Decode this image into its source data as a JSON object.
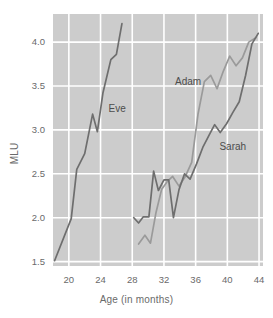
{
  "chart_data": {
    "type": "line",
    "title": "",
    "xlabel": "Age (in months)",
    "ylabel": "MLU",
    "xlim": [
      18,
      44.5
    ],
    "ylim": [
      1.45,
      4.32
    ],
    "xticks": [
      20,
      24,
      28,
      32,
      36,
      40,
      44
    ],
    "xticklabels": [
      "20",
      "24",
      "28",
      "32",
      "36",
      "40",
      "44"
    ],
    "yticks": [
      1.5,
      2.0,
      2.5,
      3.0,
      3.5,
      4.0
    ],
    "yticklabels": [
      "1.5",
      "2.0",
      "2.5",
      "3.0",
      "3.5",
      "4.0"
    ],
    "grid": true,
    "grid_color": "#ffffff",
    "plot_background": "#cccccc",
    "legend": "inline-labels",
    "series": [
      {
        "name": "Eve",
        "color": "#6e6e6e",
        "label_x": 25.0,
        "label_y": 3.24,
        "x": [
          18.2,
          20.3,
          21.0,
          22.0,
          23.0,
          23.6,
          24.3,
          25.3,
          26.0,
          26.7
        ],
        "y": [
          1.51,
          1.99,
          2.55,
          2.73,
          3.18,
          2.98,
          3.42,
          3.8,
          3.86,
          4.21
        ]
      },
      {
        "name": "Adam",
        "color": "#9a9a9a",
        "label_x": 33.4,
        "label_y": 3.54,
        "x": [
          28.8,
          29.6,
          30.3,
          31.0,
          31.7,
          32.4,
          33.1,
          33.9,
          34.7,
          35.5,
          36.3,
          37.1,
          37.9,
          38.7,
          39.5,
          40.3,
          41.1,
          41.9,
          42.7,
          43.6
        ],
        "y": [
          1.7,
          1.8,
          1.71,
          2.06,
          2.32,
          2.41,
          2.47,
          2.36,
          2.47,
          2.63,
          3.18,
          3.55,
          3.62,
          3.47,
          3.67,
          3.84,
          3.73,
          3.82,
          4.0,
          4.05
        ]
      },
      {
        "name": "Sarah",
        "color": "#6e6e6e",
        "label_x": 39.0,
        "label_y": 2.8,
        "x": [
          28.2,
          28.8,
          29.4,
          30.1,
          30.7,
          31.3,
          32.0,
          32.6,
          33.2,
          33.9,
          34.6,
          35.3,
          36.1,
          36.9,
          37.7,
          38.4,
          39.1,
          39.9,
          40.7,
          41.5,
          42.3,
          43.1,
          43.9
        ],
        "y": [
          2.0,
          1.94,
          2.01,
          2.01,
          2.53,
          2.31,
          2.43,
          2.43,
          2.0,
          2.32,
          2.5,
          2.44,
          2.61,
          2.8,
          2.94,
          3.06,
          2.97,
          3.07,
          3.2,
          3.32,
          3.62,
          3.98,
          4.1
        ]
      }
    ]
  }
}
